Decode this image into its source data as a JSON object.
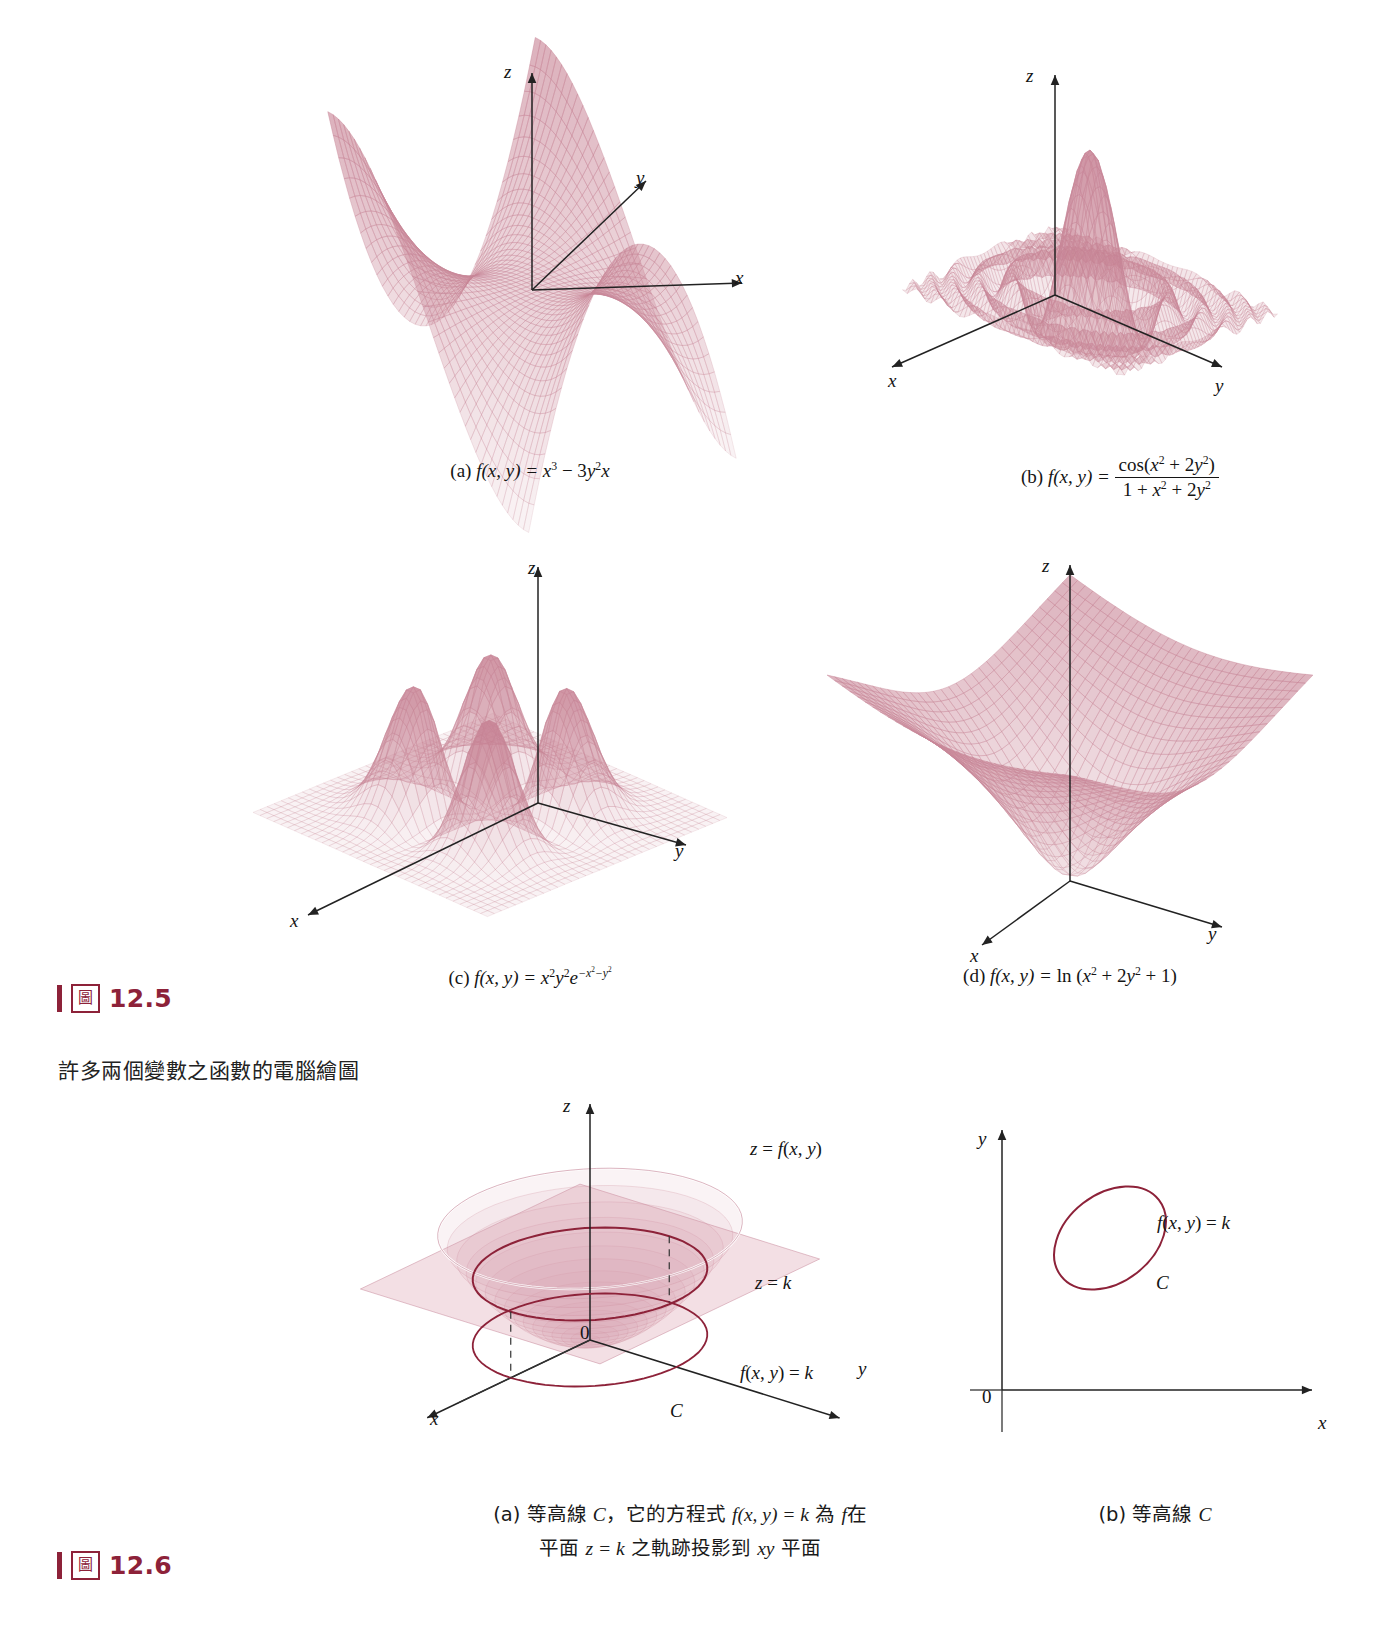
{
  "page": {
    "background": "#ffffff",
    "accent_color": "#8d2239",
    "mesh_color": "#c9899a",
    "curve_color": "#8d2239"
  },
  "figure_12_5": {
    "tag": {
      "glyph": "圖",
      "number": "12.5"
    },
    "chinese_caption": "許多兩個變數之函數的電腦繪圖",
    "panels": [
      {
        "key": "a",
        "label": "(a)",
        "function_plain": "f(x, y) = x^3 - 3y^2 x",
        "caption_parts": {
          "prefix": "(a) ",
          "fname": "f",
          "args": "(x, y) = ",
          "body": "x³ − 3y²x"
        },
        "axes": [
          "z",
          "y",
          "x"
        ],
        "surface_type": "monkey-saddle"
      },
      {
        "key": "b",
        "label": "(b)",
        "function_plain": "f(x, y) = cos(x^2 + 2y^2) / (1 + x^2 + 2y^2)",
        "caption_parts": {
          "prefix": "(b) ",
          "fname": "f",
          "args": "(x, y) = ",
          "numerator": "cos(x² + 2y²)",
          "denominator": "1 + x² + 2y²"
        },
        "axes": [
          "z",
          "x",
          "y"
        ],
        "surface_type": "damped-ripple"
      },
      {
        "key": "c",
        "label": "(c)",
        "function_plain": "f(x, y) = x^2 y^2 e^(-x^2 - y^2)",
        "caption_parts": {
          "prefix": "(c) ",
          "fname": "f",
          "args": "(x, y) = ",
          "body": "x²y²e^−x²−y²"
        },
        "axes": [
          "z",
          "y",
          "x"
        ],
        "surface_type": "four-peaks"
      },
      {
        "key": "d",
        "label": "(d)",
        "function_plain": "f(x, y) = ln (x^2 + 2y^2 + 1)",
        "caption_parts": {
          "prefix": "(d) ",
          "fname": "f",
          "args": "(x, y) = ",
          "body": "ln (x² + 2y² + 1)"
        },
        "axes": [
          "z",
          "y",
          "x"
        ],
        "surface_type": "log-bowl"
      }
    ]
  },
  "figure_12_6": {
    "tag": {
      "glyph": "圖",
      "number": "12.6"
    },
    "panel_a": {
      "label": "(a)",
      "axes": [
        "z",
        "y",
        "x"
      ],
      "origin_label": "0",
      "surface_label": "z = f(x, y)",
      "plane_label": "z = k",
      "trace_label": "f(x, y) = k",
      "curve_label": "C",
      "caption_line1": "(a) 等高線 C，它的方程式 f(x, y) = k 為 f 在",
      "caption_line2": "平面 z = k 之軌跡投影到 xy 平面",
      "caption_line1_parts": {
        "p1": "(a) 等高線 ",
        "c": "C",
        "p2": "，它的方程式 ",
        "eq": "f(x, y) = k",
        "p3": " 為 ",
        "f": "f",
        "p4": "在"
      },
      "caption_line2_parts": {
        "p1": "平面 ",
        "eq": "z = k",
        "p2": " 之軌跡投影到 ",
        "xy": "xy",
        "p3": " 平面"
      }
    },
    "panel_b": {
      "label": "(b)",
      "axes": [
        "y",
        "x"
      ],
      "origin_label": "0",
      "curve_equation_label": "f(x, y) = k",
      "curve_label": "C",
      "caption": "(b) 等高線 C",
      "caption_parts": {
        "p1": "(b) 等高線 ",
        "c": "C"
      }
    }
  },
  "chart_data": {
    "type": "line",
    "surfaces": [
      {
        "id": "a",
        "expression": "x^3 - 3*y^2*x",
        "domain_x": [
          -2,
          2
        ],
        "domain_y": [
          -2,
          2
        ],
        "grid": 40,
        "zrange": [
          -8,
          8
        ]
      },
      {
        "id": "b",
        "expression": "cos(x^2 + 2*y^2)/(1 + x^2 + 2*y^2)",
        "domain_x": [
          -4,
          4
        ],
        "domain_y": [
          -4,
          4
        ],
        "grid": 44,
        "zrange": [
          -0.3,
          1
        ]
      },
      {
        "id": "c",
        "expression": "x^2*y^2*exp(-x^2-y^2)",
        "domain_x": [
          -3,
          3
        ],
        "domain_y": [
          -3,
          3
        ],
        "grid": 36,
        "zrange": [
          0,
          0.14
        ]
      },
      {
        "id": "d",
        "expression": "ln(x^2 + 2*y^2 + 1)",
        "domain_x": [
          -3,
          3
        ],
        "domain_y": [
          -3,
          3
        ],
        "grid": 34,
        "zrange": [
          0,
          3
        ]
      }
    ],
    "level_curve": {
      "surface": "paraboloid z = x^2 + y^2",
      "plane": "z = k",
      "projection": "f(x,y) = k on xy-plane",
      "curve_name": "C"
    }
  }
}
